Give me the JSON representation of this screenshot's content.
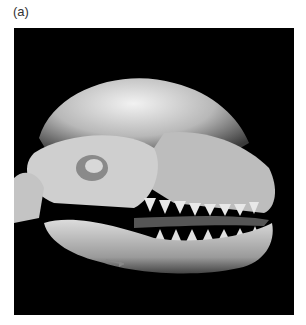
{
  "figure": {
    "label": "(a)",
    "image": {
      "description": "3D volume-rendered CT reconstruction of a canine skull, lateral view, on black background",
      "background_color": "#000000",
      "annotation": "small arrow pointing at mandible (lower left)"
    }
  }
}
